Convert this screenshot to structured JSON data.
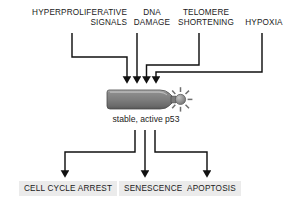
{
  "diagram": {
    "colors": {
      "background": "#ffffff",
      "stroke": "#111111",
      "text": "#1a1a1a",
      "bomb_body": "#808080",
      "bomb_highlight": "#b4b4b4",
      "bomb_shadow": "#5a5a5a",
      "spark_fill": "#9a9a9a",
      "outcome_box_fill": "#ebebeb"
    },
    "stimuli": [
      {
        "id": "hyperproliferative-signals",
        "line1": "HYPERPROLIFERATIVE",
        "line2": "SIGNALS"
      },
      {
        "id": "dna-damage",
        "line1": "DNA",
        "line2": "DAMAGE"
      },
      {
        "id": "telomere-shortening",
        "line1": "TELOMERE",
        "line2": "SHORTENING"
      },
      {
        "id": "hypoxia",
        "line1": "HYPOXIA",
        "line2": ""
      }
    ],
    "center": {
      "icon": "lit-bomb-icon",
      "caption": "stable, active p53"
    },
    "outcomes": [
      {
        "id": "cell-cycle-arrest",
        "label": "CELL CYCLE ARREST"
      },
      {
        "id": "senescence",
        "label": "SENESCENCE"
      },
      {
        "id": "apoptosis",
        "label": "APOPTOSIS"
      }
    ]
  }
}
